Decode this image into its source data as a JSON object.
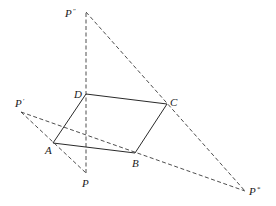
{
  "diagram": {
    "type": "geometric-construction",
    "points": {
      "P2": {
        "label": "P",
        "mark": "″",
        "x": 86,
        "y": 12
      },
      "D": {
        "label": "D",
        "x": 86,
        "y": 94
      },
      "C": {
        "label": "C",
        "x": 167,
        "y": 104
      },
      "A": {
        "label": "A",
        "x": 53,
        "y": 143
      },
      "B": {
        "label": "B",
        "x": 135,
        "y": 153
      },
      "P": {
        "label": "P",
        "x": 86,
        "y": 173
      },
      "P1": {
        "label": "P",
        "mark": "′",
        "x": 21,
        "y": 112
      },
      "P3": {
        "label": "P",
        "mark": "*",
        "x": 245,
        "y": 191
      }
    },
    "solid_segments": [
      [
        "A",
        "B"
      ],
      [
        "B",
        "C"
      ],
      [
        "C",
        "D"
      ],
      [
        "D",
        "A"
      ]
    ],
    "dashed_segments": [
      [
        "P",
        "P2"
      ],
      [
        "P2",
        "P3"
      ],
      [
        "P1",
        "P3"
      ],
      [
        "P1",
        "P"
      ]
    ],
    "labels": {
      "P2": "P",
      "P2_mark": "″",
      "D": "D",
      "C": "C",
      "A": "A",
      "B": "B",
      "P": "P",
      "P1": "P",
      "P1_mark": "′",
      "P3": "P",
      "P3_mark": "*"
    },
    "colors": {
      "line": "#2a2a2a",
      "background": "#ffffff"
    }
  }
}
